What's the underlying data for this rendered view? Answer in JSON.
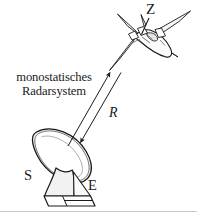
{
  "figure": {
    "title": "monostatisches Radarsystem",
    "kind": "radar-range-diagram",
    "width": 197,
    "height": 212,
    "background": "#ffffff",
    "ink_color": "#1a1a1a",
    "fill_color": "#f2f2f2"
  },
  "caption": {
    "line1": "monostatisches",
    "line2": "Radarsystem"
  },
  "labels": {
    "target": "Z",
    "range": "R",
    "transmit": "S",
    "receive": "E"
  },
  "elements": {
    "antenna_name": "parabolic-dish-antenna",
    "target_name": "aircraft-target",
    "range_name": "range-double-arrow",
    "leader_name": "target-leader-line"
  }
}
